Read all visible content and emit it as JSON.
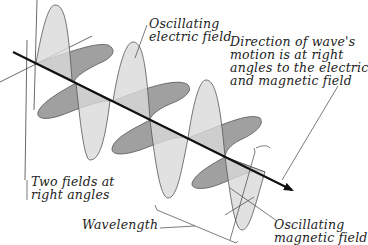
{
  "diagram": {
    "labels": {
      "electric": "Oscillating\nelectric field",
      "direction": "Direction of wave's\nmotion is at right\nangles to the electric\nand magnetic field",
      "two_fields": "Two fields at\nright angles",
      "wavelength": "Wavelength",
      "magnetic": "Oscillating\nmagnetic field"
    },
    "colors": {
      "electric_fill": "#d9d9d9",
      "magnetic_fill": "#8f8f8f",
      "outline": "#555555",
      "axis": "#111111",
      "leader": "#444444",
      "text": "#222222"
    }
  }
}
